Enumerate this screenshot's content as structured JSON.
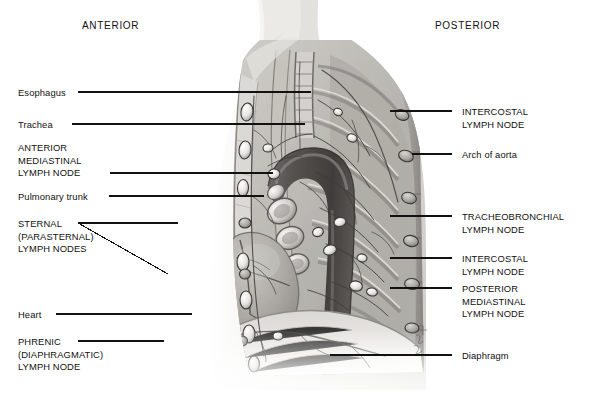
{
  "figure": {
    "orientation": {
      "anterior_label": "ANTERIOR",
      "posterior_label": "POSTERIOR"
    },
    "background_color": "#ffffff",
    "ink_color": "#111111",
    "style": "grayscale medical illustration, pencil/airbrush rendering"
  },
  "left_labels": [
    {
      "id": "esophagus",
      "text": "Esophagus",
      "lines": [
        "Esophagus"
      ],
      "caps": false,
      "x": 18,
      "y": 87,
      "leader": {
        "type": "line",
        "x1": 78,
        "y1": 92,
        "x2": 311,
        "y2": 92
      }
    },
    {
      "id": "trachea",
      "text": "Trachea",
      "lines": [
        "Trachea"
      ],
      "caps": false,
      "x": 18,
      "y": 119,
      "leader": {
        "type": "line",
        "x1": 72,
        "y1": 124,
        "x2": 305,
        "y2": 124
      }
    },
    {
      "id": "anterior-mediastinal",
      "text": "ANTERIOR MEDIASTINAL LYMPH NODE",
      "lines": [
        "ANTERIOR",
        "MEDIASTINAL",
        "LYMPH NODE"
      ],
      "caps": true,
      "x": 18,
      "y": 142,
      "leader": {
        "type": "line",
        "x1": 110,
        "y1": 173,
        "x2": 273,
        "y2": 173
      }
    },
    {
      "id": "pulmonary-trunk",
      "text": "Pulmonary trunk",
      "lines": [
        "Pulmonary trunk"
      ],
      "caps": false,
      "x": 18,
      "y": 191,
      "leader": {
        "type": "line",
        "x1": 109,
        "y1": 196,
        "x2": 264,
        "y2": 196
      }
    },
    {
      "id": "sternal",
      "text": "STERNAL (PARASTERNAL) LYMPH NODES",
      "lines": [
        "STERNAL",
        "(PARASTERNAL)",
        "LYMPH NODES"
      ],
      "caps": true,
      "x": 18,
      "y": 218,
      "leader": {
        "type": "fork",
        "x1": 78,
        "y1": 223,
        "x2": 178,
        "y2": 223,
        "x3": 168,
        "y3": 274
      }
    },
    {
      "id": "heart",
      "text": "Heart",
      "lines": [
        "Heart"
      ],
      "caps": false,
      "x": 18,
      "y": 309,
      "leader": {
        "type": "line",
        "x1": 56,
        "y1": 314,
        "x2": 192,
        "y2": 314
      }
    },
    {
      "id": "phrenic",
      "text": "PHRENIC (DIAPHRAGMATIC) LYMPH NODE",
      "lines": [
        "PHRENIC",
        "(DIAPHRAGMATIC)",
        "LYMPH NODE"
      ],
      "caps": true,
      "x": 18,
      "y": 336,
      "leader": {
        "type": "line",
        "x1": 78,
        "y1": 341,
        "x2": 164,
        "y2": 341
      }
    }
  ],
  "right_labels": [
    {
      "id": "intercostal-upper",
      "text": "INTERCOSTAL LYMPH NODE",
      "lines": [
        "INTERCOSTAL",
        "LYMPH NODE"
      ],
      "caps": true,
      "x": 462,
      "y": 106,
      "leader": {
        "type": "line",
        "x1": 390,
        "y1": 111,
        "x2": 452,
        "y2": 111
      }
    },
    {
      "id": "arch-of-aorta",
      "text": "Arch of aorta",
      "lines": [
        "Arch of aorta"
      ],
      "caps": false,
      "x": 462,
      "y": 149,
      "leader": {
        "type": "line",
        "x1": 412,
        "y1": 154,
        "x2": 452,
        "y2": 154
      }
    },
    {
      "id": "tracheobronchial",
      "text": "TRACHEOBRONCHIAL LYMPH NODE",
      "lines": [
        "TRACHEOBRONCHIAL",
        "LYMPH NODE"
      ],
      "caps": true,
      "x": 462,
      "y": 211,
      "leader": {
        "type": "line",
        "x1": 390,
        "y1": 216,
        "x2": 452,
        "y2": 216
      }
    },
    {
      "id": "intercostal-lower",
      "text": "INTERCOSTAL LYMPH NODE",
      "lines": [
        "INTERCOSTAL",
        "LYMPH NODE"
      ],
      "caps": true,
      "x": 462,
      "y": 253,
      "leader": {
        "type": "line",
        "x1": 390,
        "y1": 258,
        "x2": 452,
        "y2": 258
      }
    },
    {
      "id": "posterior-mediastinal",
      "text": "POSTERIOR MEDIASTINAL LYMPH NODE",
      "lines": [
        "POSTERIOR",
        "MEDIASTINAL",
        "LYMPH NODE"
      ],
      "caps": true,
      "x": 462,
      "y": 283,
      "leader": {
        "type": "line",
        "x1": 390,
        "y1": 288,
        "x2": 452,
        "y2": 288
      }
    },
    {
      "id": "diaphragm",
      "text": "Diaphragm",
      "lines": [
        "Diaphragm"
      ],
      "caps": false,
      "x": 462,
      "y": 350,
      "leader": {
        "type": "line",
        "x1": 330,
        "y1": 355,
        "x2": 452,
        "y2": 355
      }
    }
  ],
  "anatomy_structures": [
    "neck and shoulder silhouette",
    "thoracic wall with ribs",
    "vertebral column",
    "trachea",
    "esophagus",
    "arch of aorta",
    "pulmonary trunk",
    "heart",
    "diaphragm",
    "lymphatic vessel network",
    "lymph nodes along ribs and mediastinum"
  ],
  "artist_signature": {
    "present": true,
    "x": 418,
    "y": 340
  }
}
